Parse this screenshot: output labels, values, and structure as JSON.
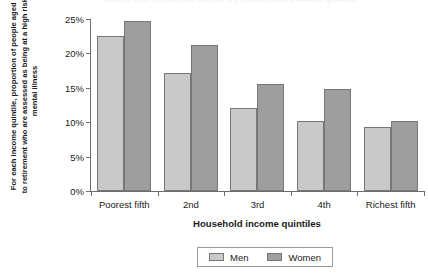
{
  "chart_data": {
    "type": "bar",
    "title": "",
    "clipped_top_title": "Chart: risk of mental illness by household income quintile",
    "categories": [
      "Poorest fifth",
      "2nd",
      "3rd",
      "4th",
      "Richest fifth"
    ],
    "series": [
      {
        "name": "Men",
        "color": "#c9c9c9",
        "values": [
          22.6,
          17.1,
          12.0,
          10.2,
          9.3
        ]
      },
      {
        "name": "Women",
        "color": "#9e9e9e",
        "values": [
          24.7,
          21.2,
          15.5,
          14.8,
          10.2
        ]
      }
    ],
    "xlabel": "Household income quintiles",
    "ylabel": "For each income quintile, proportion of people aged 16 to retirement who are assessed as being at a high risk of mental illness",
    "ylim": [
      0,
      25
    ],
    "yticks": [
      0,
      5,
      10,
      15,
      20,
      25
    ],
    "ytick_labels": [
      "0%",
      "5%",
      "10%",
      "15%",
      "20%",
      "25%"
    ],
    "grid": false,
    "legend_position": "bottom-center",
    "axis_color": "#6e6e6e",
    "bar_border_color": "#777777"
  }
}
